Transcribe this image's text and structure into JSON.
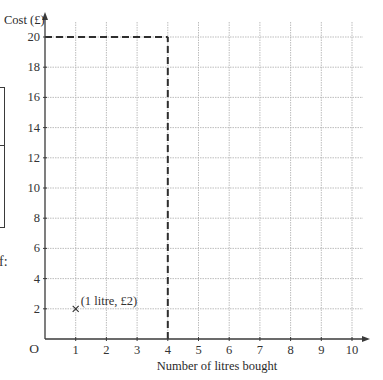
{
  "chart_data": {
    "type": "line",
    "title": "",
    "xlabel": "Number of litres bought",
    "ylabel": "Cost (£)",
    "origin_label": "O",
    "xlim": [
      0,
      10
    ],
    "ylim": [
      0,
      20
    ],
    "x_ticks": [
      1,
      2,
      3,
      4,
      5,
      6,
      7,
      8,
      9,
      10
    ],
    "x_tick_labels": [
      "1",
      "2",
      "3",
      "4",
      "5",
      "6",
      "7",
      "8",
      "9",
      "10"
    ],
    "y_ticks": [
      2,
      4,
      6,
      8,
      10,
      12,
      14,
      16,
      18,
      20
    ],
    "y_tick_labels": [
      "2",
      "4",
      "6",
      "8",
      "10",
      "12",
      "14",
      "16",
      "18",
      "20"
    ],
    "grid": true,
    "legend": null,
    "points": [
      {
        "x": 1,
        "y": 2,
        "marker": "×",
        "label": "(1 litre, £2)"
      }
    ],
    "reference_lines": [
      {
        "type": "dashed",
        "from": [
          0,
          20
        ],
        "to": [
          4,
          20
        ],
        "description": "horizontal dashed line at £20 from y-axis to x = 4"
      },
      {
        "type": "dashed",
        "from": [
          4,
          0
        ],
        "to": [
          4,
          20
        ],
        "description": "vertical dashed line at 4 litres from x-axis up to £20"
      }
    ]
  },
  "labels": {
    "y_axis_title": "Cost (£)",
    "x_axis_title": "Number of litres bought",
    "origin": "O",
    "point_annotation": "(1 litre, £2)",
    "point_marker": "×",
    "side_fragment": "f:"
  },
  "colors": {
    "axis": "#3a3a3a",
    "grid": "#b5b5b5",
    "dashed": "#2e2e2e",
    "text": "#333333",
    "background": "#ffffff"
  }
}
